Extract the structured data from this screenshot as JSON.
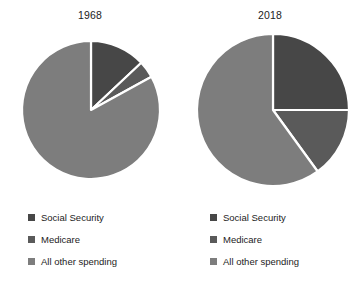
{
  "chart_data": [
    {
      "type": "pie",
      "title": "1968",
      "categories": [
        "Social Security",
        "Medicare",
        "All other spending"
      ],
      "values": [
        13,
        4,
        83
      ],
      "colors": [
        "#474747",
        "#5a5a5a",
        "#7d7d7d"
      ],
      "start_angle_deg": 0,
      "direction": "clockwise",
      "legend_position": "bottom-left",
      "grid": false,
      "xlabel": "",
      "ylabel": "",
      "center": {
        "x": 91,
        "y": 110
      },
      "radius": 69,
      "separator_color": "#ffffff"
    },
    {
      "type": "pie",
      "title": "2018",
      "categories": [
        "Social Security",
        "Medicare",
        "All other spending"
      ],
      "values": [
        25,
        15,
        60
      ],
      "colors": [
        "#474747",
        "#5a5a5a",
        "#7d7d7d"
      ],
      "start_angle_deg": 0,
      "direction": "clockwise",
      "legend_position": "bottom-left",
      "grid": false,
      "xlabel": "",
      "ylabel": "",
      "center": {
        "x": 273,
        "y": 110
      },
      "radius": 76,
      "separator_color": "#ffffff"
    }
  ],
  "panels": [
    {
      "title": "1968",
      "legend": [
        {
          "label": "Social Security",
          "color": "#474747"
        },
        {
          "label": "Medicare",
          "color": "#5a5a5a"
        },
        {
          "label": "All other spending",
          "color": "#7d7d7d"
        }
      ]
    },
    {
      "title": "2018",
      "legend": [
        {
          "label": "Social Security",
          "color": "#474747"
        },
        {
          "label": "Medicare",
          "color": "#5a5a5a"
        },
        {
          "label": "All other spending",
          "color": "#7d7d7d"
        }
      ]
    }
  ],
  "palette": {
    "social_security": "#474747",
    "medicare": "#5a5a5a",
    "all_other_spending": "#7d7d7d",
    "separator": "#ffffff",
    "background": "#ffffff",
    "text": "#1c1c1c"
  }
}
